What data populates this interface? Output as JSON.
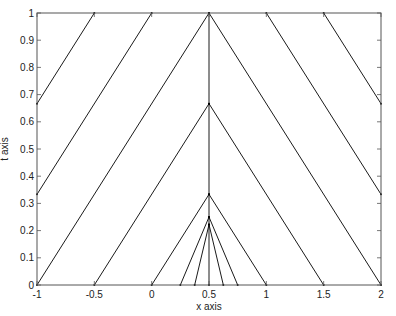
{
  "chart_data": {
    "type": "line",
    "title": "",
    "xlabel": "x axis",
    "ylabel": "t axis",
    "xlim": [
      -1,
      2
    ],
    "ylim": [
      0,
      1
    ],
    "grid": false,
    "legend": null,
    "xticks": [
      -1,
      -0.5,
      0,
      0.5,
      1,
      1.5,
      2
    ],
    "xtick_labels": [
      "-1",
      "-0.5",
      "0",
      "0.5",
      "1",
      "1.5",
      "2"
    ],
    "yticks": [
      0,
      0.1,
      0.2,
      0.3,
      0.4,
      0.5,
      0.6,
      0.7,
      0.8,
      0.9,
      1
    ],
    "ytick_labels": [
      "0",
      "0.1",
      "0.2",
      "0.3",
      "0.4",
      "0.5",
      "0.6",
      "0.7",
      "0.8",
      "0.9",
      "1"
    ],
    "line_color": "#000000",
    "series": [
      {
        "name": "char-left-1",
        "x": [
          -1,
          -0.5
        ],
        "y": [
          0.6667,
          1
        ]
      },
      {
        "name": "char-left-2",
        "x": [
          -1,
          0
        ],
        "y": [
          0.3333,
          1
        ]
      },
      {
        "name": "char-left-3",
        "x": [
          -1,
          0.5
        ],
        "y": [
          0,
          1
        ]
      },
      {
        "name": "char-left-4",
        "x": [
          -0.5,
          0.5
        ],
        "y": [
          0,
          0.6667
        ]
      },
      {
        "name": "char-left-5",
        "x": [
          0,
          0.5
        ],
        "y": [
          0,
          0.3333
        ]
      },
      {
        "name": "char-left-6",
        "x": [
          0.25,
          0.5
        ],
        "y": [
          0,
          0.25
        ]
      },
      {
        "name": "char-left-7",
        "x": [
          0.375,
          0.5
        ],
        "y": [
          0,
          0.2222
        ]
      },
      {
        "name": "shock-center",
        "x": [
          0.5,
          0.5
        ],
        "y": [
          0,
          1
        ]
      },
      {
        "name": "char-right-7",
        "x": [
          0.625,
          0.5
        ],
        "y": [
          0,
          0.2222
        ]
      },
      {
        "name": "char-right-6",
        "x": [
          0.75,
          0.5
        ],
        "y": [
          0,
          0.25
        ]
      },
      {
        "name": "char-right-5",
        "x": [
          1,
          0.5
        ],
        "y": [
          0,
          0.3333
        ]
      },
      {
        "name": "char-right-4",
        "x": [
          1.5,
          0.5
        ],
        "y": [
          0,
          0.6667
        ]
      },
      {
        "name": "char-right-3",
        "x": [
          2,
          0.5
        ],
        "y": [
          0,
          1
        ]
      },
      {
        "name": "char-right-2",
        "x": [
          2,
          1
        ],
        "y": [
          0.3333,
          1
        ]
      },
      {
        "name": "char-right-1",
        "x": [
          2,
          1.5
        ],
        "y": [
          0.6667,
          1
        ]
      }
    ]
  }
}
